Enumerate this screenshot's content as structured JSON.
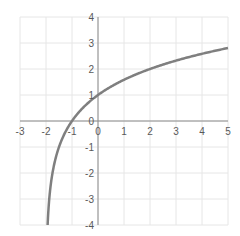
{
  "chart_data": {
    "type": "line",
    "title": "",
    "xlabel": "",
    "ylabel": "",
    "function": "y = log2(x + 2)",
    "xlim": [
      -3,
      5
    ],
    "ylim": [
      -4,
      4
    ],
    "grid": true,
    "legend": null,
    "x_ticks": [
      "-3",
      "-2",
      "-1",
      "0",
      "1",
      "2",
      "3",
      "4",
      "5"
    ],
    "y_ticks": [
      "4",
      "3",
      "2",
      "1",
      "0",
      "-1",
      "-2",
      "-3",
      "-4"
    ],
    "series": [
      {
        "name": "curve",
        "color": "#7f7f7f",
        "x": [
          -1.9375,
          -1.875,
          -1.75,
          -1.5,
          -1,
          0,
          1,
          2,
          3,
          4,
          5
        ],
        "y": [
          -4,
          -3,
          -2,
          -1,
          0,
          1,
          1.585,
          2,
          2.322,
          2.585,
          2.807
        ]
      }
    ]
  },
  "colors": {
    "grid": "#e6e6e6",
    "axis": "#8c8c8c",
    "curve": "#7f7f7f",
    "tick_text": "#595959"
  }
}
